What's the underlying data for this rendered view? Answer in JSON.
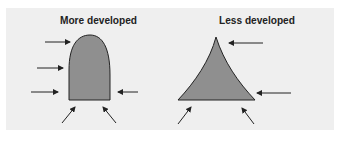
{
  "diagram": {
    "panel_color": "#efefef",
    "shape_fill": "#8f8f8f",
    "left": {
      "title": "More developed",
      "shape": "dome (rounded bullet)"
    },
    "right": {
      "title": "Less developed",
      "shape": "concave triangle (pyramid)"
    },
    "arrows": {
      "left_count": 6,
      "right_count": 4
    }
  }
}
